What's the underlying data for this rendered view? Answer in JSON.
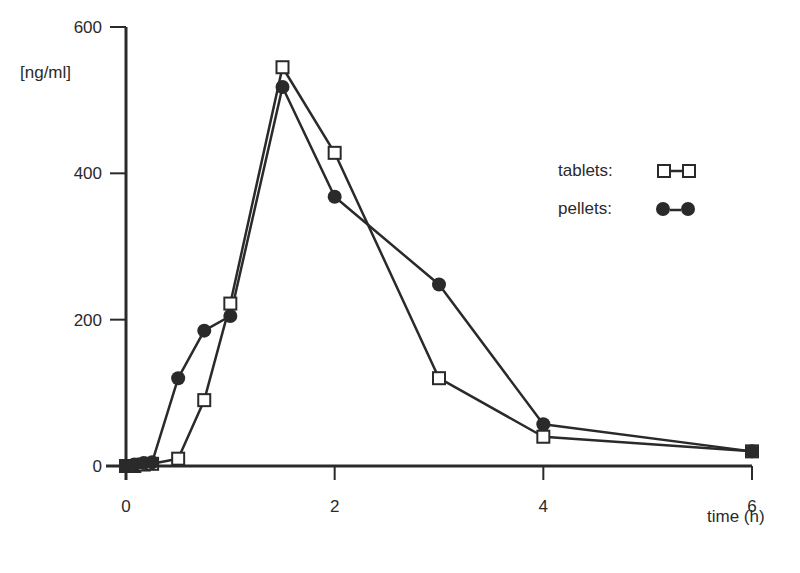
{
  "chart_data": {
    "type": "line",
    "title": "",
    "xlabel": "time (h)",
    "ylabel": "[ng/ml]",
    "xlim": [
      0,
      6
    ],
    "ylim": [
      0,
      600
    ],
    "x_ticks": [
      "0",
      "2",
      "4",
      "6"
    ],
    "y_ticks": [
      "0",
      "200",
      "400",
      "600"
    ],
    "grid": false,
    "legend_position": "upper right",
    "series": [
      {
        "name": "tablets",
        "marker": "open-square",
        "x": [
          0,
          0.08,
          0.17,
          0.25,
          0.5,
          0.75,
          1,
          1.5,
          2,
          3,
          4,
          6
        ],
        "values": [
          0,
          0,
          2,
          3,
          10,
          90,
          222,
          545,
          428,
          120,
          40,
          20
        ]
      },
      {
        "name": "pellets",
        "marker": "filled-circle",
        "x": [
          0,
          0.08,
          0.17,
          0.25,
          0.5,
          0.75,
          1,
          1.5,
          2,
          3,
          4,
          6
        ],
        "values": [
          0,
          2,
          4,
          5,
          120,
          185,
          205,
          518,
          368,
          248,
          57,
          20
        ]
      }
    ]
  },
  "legend": {
    "tablets_label": "tablets:",
    "pellets_label": "pellets:"
  },
  "axes": {
    "ylabel": "[ng/ml]",
    "xlabel": "time (h)",
    "y_ticks": [
      "0",
      "200",
      "400",
      "600"
    ],
    "x_ticks": [
      "0",
      "2",
      "4",
      "6"
    ]
  }
}
